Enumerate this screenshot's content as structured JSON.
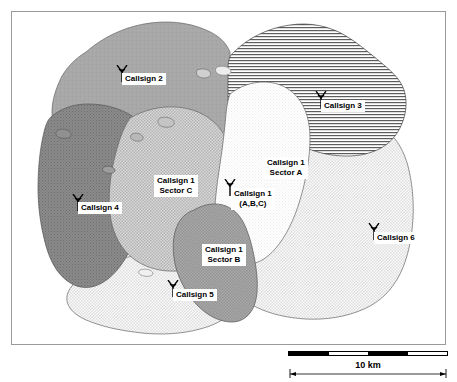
{
  "map": {
    "title": "Radio network coverage map",
    "frame_border_color": "#9a9a9a",
    "background": "#ffffff",
    "regions": [
      {
        "id": "callsign-2",
        "label": "Callsign 2",
        "fill": "#a6a6a6",
        "pattern": "solid-gray"
      },
      {
        "id": "callsign-3",
        "label": "Callsign 3",
        "fill": "#ffffff",
        "pattern": "horizontal-lines"
      },
      {
        "id": "callsign-4",
        "label": "Callsign 4",
        "fill": "#8f8f8f",
        "pattern": "dark-crosshatch"
      },
      {
        "id": "callsign-5",
        "label": "Callsign 5",
        "fill": "#e3e3e3",
        "pattern": "light-dots"
      },
      {
        "id": "callsign-6",
        "label": "Callsign 6",
        "fill": "#e3e3e3",
        "pattern": "light-dots"
      },
      {
        "id": "callsign-1-sector-a",
        "label": "Callsign 1\nSector A",
        "fill": "#f2f2f2",
        "pattern": "very-light-dots"
      },
      {
        "id": "callsign-1-sector-b",
        "label": "Callsign 1\nSector B",
        "fill": "#a0a0a0",
        "pattern": "medium-dots"
      },
      {
        "id": "callsign-1-sector-c",
        "label": "Callsign 1\nSector C",
        "fill": "#c9c9c9",
        "pattern": "mid-checker"
      }
    ],
    "sites": [
      {
        "id": "site-callsign-2",
        "line1": "Callsign 2",
        "line2": ""
      },
      {
        "id": "site-callsign-3",
        "line1": "Callsign 3",
        "line2": ""
      },
      {
        "id": "site-callsign-4",
        "line1": "Callsign 4",
        "line2": ""
      },
      {
        "id": "site-callsign-5",
        "line1": "Callsign 5",
        "line2": ""
      },
      {
        "id": "site-callsign-6",
        "line1": "Callsign 6",
        "line2": ""
      },
      {
        "id": "site-callsign-1-abc",
        "line1": "Callsign 1",
        "line2": "(A,B,C)"
      }
    ],
    "area_labels": [
      {
        "id": "label-sector-a",
        "line1": "Callsign 1",
        "line2": "Sector A"
      },
      {
        "id": "label-sector-b",
        "line1": "Callsign 1",
        "line2": "Sector B"
      },
      {
        "id": "label-sector-c",
        "line1": "Callsign 1",
        "line2": "Sector C"
      }
    ]
  },
  "scale": {
    "label": "10 km",
    "segments": [
      "dark",
      "light",
      "dark",
      "light"
    ]
  }
}
